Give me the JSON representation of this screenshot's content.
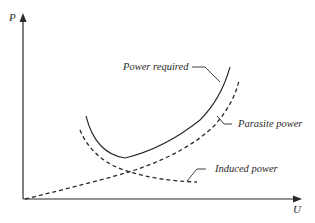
{
  "diagram": {
    "axes": {
      "y_label": "P",
      "x_label": "U"
    },
    "curves": [
      {
        "id": "power-required",
        "label": "Power required",
        "style": "solid"
      },
      {
        "id": "parasite-power",
        "label": "Parasite power",
        "style": "dashed"
      },
      {
        "id": "induced-power",
        "label": "Induced power",
        "style": "dashed"
      }
    ]
  }
}
